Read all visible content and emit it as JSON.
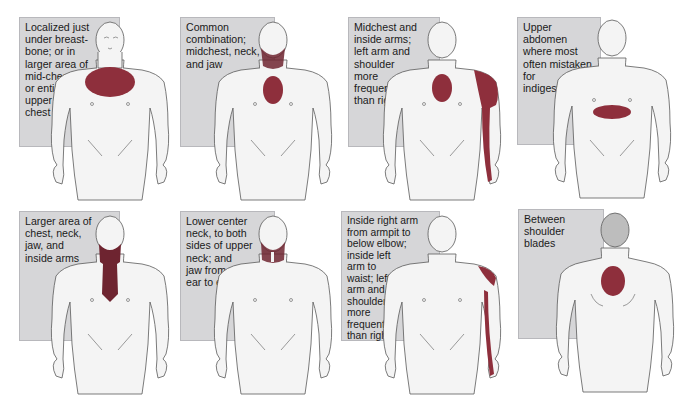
{
  "colors": {
    "pain": "#8e2f3c",
    "pain_dark": "#6e2430",
    "textbox_bg": "#d6d6d8",
    "skin": "#f4f4f4",
    "outline": "#5a5a5a",
    "back_head": "#bdbdbd"
  },
  "panels": [
    {
      "id": "p1",
      "text": "Localized just under breast-bone; or in larger area of mid-chest; or entire upper chest",
      "lines": [
        "Localized just",
        "under breast-",
        "bone; or in",
        "larger area of",
        "mid-chest;",
        "or entire",
        "upper",
        "chest"
      ],
      "view": "front",
      "pain_areas": [
        "upper-chest"
      ]
    },
    {
      "id": "p2",
      "text": "Common combination; midchest, neck, and jaw",
      "lines": [
        "Common",
        "combination;",
        "midchest, neck,",
        "and jaw"
      ],
      "view": "front",
      "pain_areas": [
        "midchest",
        "neck",
        "jaw"
      ]
    },
    {
      "id": "p3",
      "text": "Midchest and inside arms; left arm and shoulder more frequent than right",
      "lines": [
        "Midchest and",
        "inside arms;",
        "left arm and",
        "shoulder",
        "more",
        "frequent",
        "than right"
      ],
      "view": "front",
      "pain_areas": [
        "midchest",
        "left-shoulder",
        "left-inner-arm"
      ]
    },
    {
      "id": "p4",
      "text": "Upper abdomen where most often mistaken for indigestion",
      "lines": [
        "Upper abdomen",
        "where most",
        "often mistaken",
        "for",
        "indigestion"
      ],
      "view": "front",
      "pain_areas": [
        "upper-abdomen"
      ]
    },
    {
      "id": "p5",
      "text": "Larger area of chest, neck, jaw, and inside arms",
      "lines": [
        "Larger area of",
        "chest, neck,",
        "jaw, and",
        "inside arms"
      ],
      "view": "front",
      "pain_areas": [
        "jaw",
        "neck",
        "center-chest"
      ]
    },
    {
      "id": "p6",
      "text": "Lower center neck, to both sides of upper neck; and jaw from ear to ear",
      "lines": [
        "Lower center",
        "neck, to both",
        "sides of upper",
        "neck; and",
        "jaw from",
        "ear to ear"
      ],
      "view": "front",
      "pain_areas": [
        "jaw",
        "neck"
      ]
    },
    {
      "id": "p7",
      "text": "Inside right arm from armpit to below elbow; inside left arm to waist; left arm and shoulder more frequent than right",
      "lines": [
        "Inside right arm",
        "from armpit to",
        "below elbow;",
        "inside left",
        "arm to",
        "waist; left",
        "arm and",
        "shoulder",
        "more",
        "frequent",
        "than right"
      ],
      "view": "front",
      "pain_areas": [
        "left-shoulder",
        "left-inner-arm"
      ]
    },
    {
      "id": "p8",
      "text": "Between shoulder blades",
      "lines": [
        "Between",
        "shoulder",
        "blades"
      ],
      "view": "back",
      "pain_areas": [
        "between-shoulder-blades"
      ]
    }
  ]
}
